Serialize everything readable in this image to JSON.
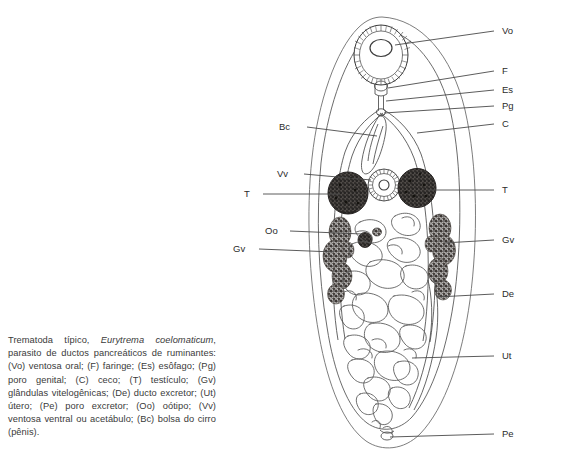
{
  "figure": {
    "organism": "Eurytrema coelomaticum",
    "view": "dorsal whole-mount line drawing"
  },
  "labels": {
    "vo": "Vo",
    "f": "F",
    "es": "Es",
    "pg": "Pg",
    "c": "C",
    "bc": "Bc",
    "vv": "Vv",
    "t_left": "T",
    "t_right": "T",
    "oo": "Oo",
    "gv_left": "Gv",
    "gv_right": "Gv",
    "de": "De",
    "ut": "Ut",
    "pe": "Pe"
  },
  "caption": {
    "part1": "Trematoda típico, ",
    "species": "Eurytrema coelomaticum",
    "part2": ", parasito de ductos pancreáticos de ruminantes: (Vo) ventosa oral; (F) faringe; (Es) esôfago; (Pg) poro genital; (C) ceco; (T) testículo; (Gv) glândulas vitelogênicas; (De) ducto excretor; (Ut) útero; (Pe) poro excretor; (Oo) oótipo; (Vv) ventosa ventral ou acetábulo; (Bc) bolsa do cirro (pênis)."
  },
  "legend_keys": [
    {
      "abbr": "Vo",
      "term": "ventosa oral"
    },
    {
      "abbr": "F",
      "term": "faringe"
    },
    {
      "abbr": "Es",
      "term": "esôfago"
    },
    {
      "abbr": "Pg",
      "term": "poro genital"
    },
    {
      "abbr": "C",
      "term": "ceco"
    },
    {
      "abbr": "T",
      "term": "testículo"
    },
    {
      "abbr": "Gv",
      "term": "glândulas vitelogênicas"
    },
    {
      "abbr": "De",
      "term": "ducto excretor"
    },
    {
      "abbr": "Ut",
      "term": "útero"
    },
    {
      "abbr": "Pe",
      "term": "poro excretor"
    },
    {
      "abbr": "Oo",
      "term": "oótipo"
    },
    {
      "abbr": "Vv",
      "term": "ventosa ventral ou acetábulo"
    },
    {
      "abbr": "Bc",
      "term": "bolsa do cirro (pênis)"
    }
  ],
  "colors": {
    "ink": "#2b2b2b",
    "outline": "#6e6e6e",
    "leader": "#4a4a4a",
    "caption_text": "#3a3a3a",
    "testis_fill": "#3d3a38",
    "vitelline_fill": "#4a4542",
    "background": "#ffffff"
  }
}
